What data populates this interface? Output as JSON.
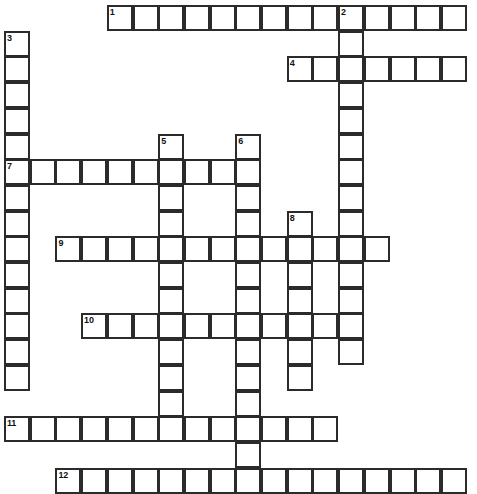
{
  "puzzle": {
    "type": "crossword-grid",
    "title": "",
    "cell_size_px": 25.7,
    "origin_x_px": 4,
    "origin_y_px": 5,
    "grid_cols": 19,
    "grid_rows": 19,
    "colors": {
      "cell_fill": "#ffffff",
      "cell_border": "#2b2b2b",
      "number_text": "#121212",
      "page_background": "#ffffff"
    },
    "entries": [
      {
        "number": "1",
        "direction": "across",
        "start_col": 4,
        "start_row": 0,
        "length": 14,
        "letters": ""
      },
      {
        "number": "2",
        "direction": "down",
        "start_col": 13,
        "start_row": 0,
        "length": 14,
        "letters": ""
      },
      {
        "number": "3",
        "direction": "down",
        "start_col": 0,
        "start_row": 1,
        "length": 14,
        "letters": ""
      },
      {
        "number": "4",
        "direction": "across",
        "start_col": 11,
        "start_row": 2,
        "length": 7,
        "letters": ""
      },
      {
        "number": "5",
        "direction": "down",
        "start_col": 6,
        "start_row": 5,
        "length": 11,
        "letters": ""
      },
      {
        "number": "6",
        "direction": "down",
        "start_col": 9,
        "start_row": 5,
        "length": 14,
        "letters": ""
      },
      {
        "number": "7",
        "direction": "across",
        "start_col": 0,
        "start_row": 6,
        "length": 9,
        "letters": ""
      },
      {
        "number": "8",
        "direction": "down",
        "start_col": 11,
        "start_row": 8,
        "length": 7,
        "letters": ""
      },
      {
        "number": "9",
        "direction": "across",
        "start_col": 2,
        "start_row": 9,
        "length": 13,
        "letters": ""
      },
      {
        "number": "10",
        "direction": "across",
        "start_col": 3,
        "start_row": 12,
        "length": 11,
        "letters": ""
      },
      {
        "number": "11",
        "direction": "across",
        "start_col": 0,
        "start_row": 16,
        "length": 13,
        "letters": ""
      },
      {
        "number": "12",
        "direction": "across",
        "start_col": 2,
        "start_row": 18,
        "length": 16,
        "letters": ""
      }
    ],
    "numbered_cells": [
      {
        "number": "1",
        "col": 4,
        "row": 0
      },
      {
        "number": "2",
        "col": 13,
        "row": 0
      },
      {
        "number": "3",
        "col": 0,
        "row": 1
      },
      {
        "number": "4",
        "col": 11,
        "row": 2
      },
      {
        "number": "5",
        "col": 6,
        "row": 5
      },
      {
        "number": "6",
        "col": 9,
        "row": 5
      },
      {
        "number": "7",
        "col": 0,
        "row": 6
      },
      {
        "number": "8",
        "col": 11,
        "row": 8
      },
      {
        "number": "9",
        "col": 2,
        "row": 9
      },
      {
        "number": "10",
        "col": 3,
        "row": 12
      },
      {
        "number": "11",
        "col": 0,
        "row": 16
      },
      {
        "number": "12",
        "col": 2,
        "row": 18
      }
    ]
  }
}
